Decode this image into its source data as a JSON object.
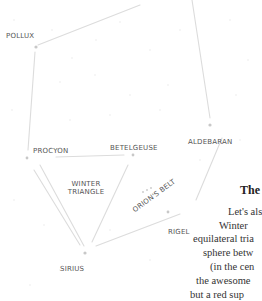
{
  "diagram": {
    "stars": [
      {
        "name": "POLLUX",
        "x": 36,
        "y": 47
      },
      {
        "name": "PROCYON",
        "x": 27,
        "y": 157
      },
      {
        "name": "BETELGEUSE",
        "x": 133,
        "y": 155
      },
      {
        "name": "ALDEBARAN",
        "x": 210,
        "y": 125
      },
      {
        "name": "RIGEL",
        "x": 193,
        "y": 208
      },
      {
        "name": "SIRIUS",
        "x": 85,
        "y": 253
      }
    ],
    "labels": {
      "pollux": "POLLUX",
      "procyon": "PROCYON",
      "betelgeuse": "BETELGEUSE",
      "aldebaran": "ALDEBARAN",
      "rigel": "RIGEL",
      "sirius": "SIRIUS",
      "triangle_line1": "WINTER",
      "triangle_line2": "TRIANGLE",
      "orions_belt": "ORION'S BELT"
    },
    "colors": {
      "line": "#dcdcdc",
      "star": "#c8c8c8",
      "label": "#555555",
      "background": "#ffffff"
    }
  },
  "article": {
    "heading": "The",
    "lines": [
      "Let's also",
      "Winter",
      "equilateral tria",
      "sphere betw",
      "(in the cen",
      "the awesome",
      "but a red sup",
      "million mil"
    ]
  }
}
